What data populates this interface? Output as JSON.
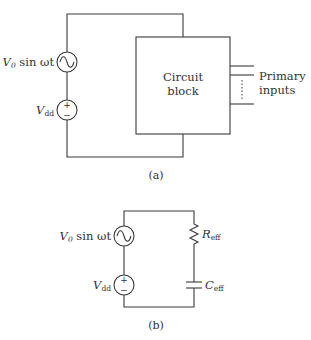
{
  "diagram": {
    "panel_a": {
      "caption": "(a)",
      "ac_source": {
        "label_v": "V",
        "label_sub": "0",
        "label_rest": " sin ωt"
      },
      "dc_source": {
        "label_v": "V",
        "label_sub": "dd",
        "plus": "+",
        "minus": "−"
      },
      "block": {
        "line1": "Circuit",
        "line2": "block"
      },
      "inputs": {
        "line1": "Primary",
        "line2": "inputs"
      }
    },
    "panel_b": {
      "caption": "(b)",
      "ac_source": {
        "label_v": "V",
        "label_sub": "0",
        "label_rest": " sin ωt"
      },
      "dc_source": {
        "label_v": "V",
        "label_sub": "dd",
        "plus": "+",
        "minus": "−"
      },
      "resistor": {
        "label": "R",
        "label_sub": "eff"
      },
      "capacitor": {
        "label": "C",
        "label_sub": "eff"
      }
    }
  }
}
